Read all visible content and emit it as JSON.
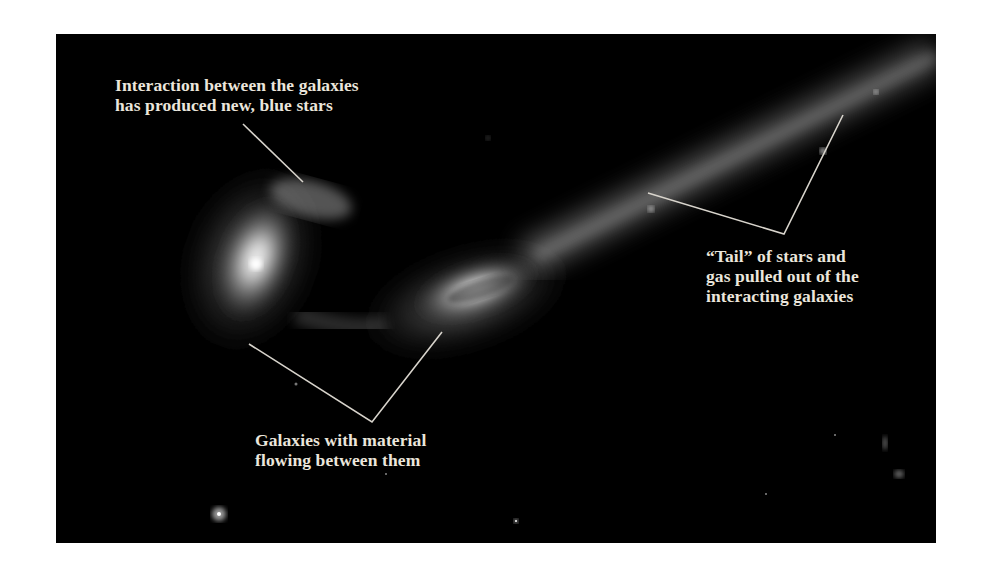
{
  "figure": {
    "background_color": "#000000",
    "line_color": "#d8d4cc",
    "annotations": [
      {
        "id": "blue-stars",
        "lines": [
          "Interaction between the galaxies",
          "has produced new, blue stars"
        ]
      },
      {
        "id": "tail",
        "lines": [
          "“Tail” of stars and",
          "gas pulled out of the",
          "interacting galaxies"
        ]
      },
      {
        "id": "material-flow",
        "lines": [
          "Galaxies with material",
          "flowing between them"
        ]
      }
    ]
  }
}
